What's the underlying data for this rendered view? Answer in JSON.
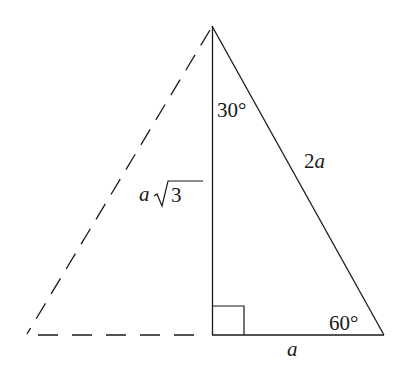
{
  "diagram": {
    "stroke_color": "#1a1a1a",
    "labels": {
      "angle_top": "30°",
      "hypotenuse": "2",
      "hypotenuse_var": "a",
      "height_var": "a",
      "height_radical": "3",
      "angle_right": "60°",
      "base": "a"
    },
    "vertices": {
      "apex": [
        212,
        26
      ],
      "foot": [
        213,
        335
      ],
      "right": [
        384,
        335
      ],
      "left_reflected": [
        27,
        335
      ]
    }
  }
}
